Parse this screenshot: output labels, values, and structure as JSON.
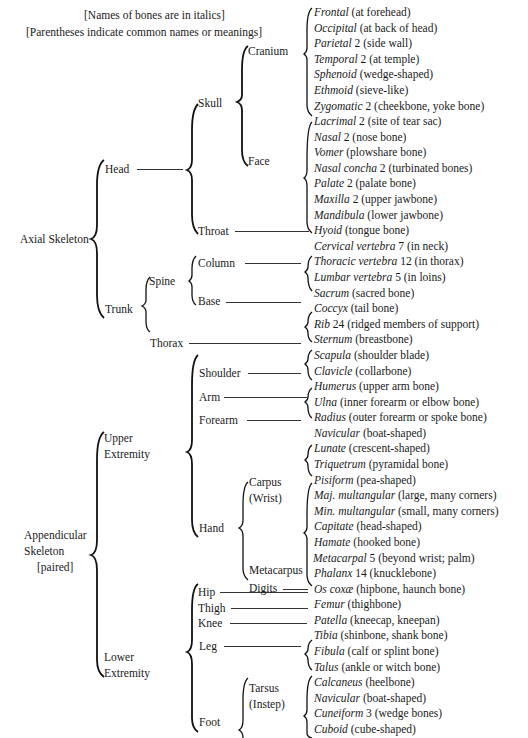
{
  "notes": {
    "italics": "[Names of bones are in italics]",
    "parentheses": "[Parentheses indicate common names or meanings]"
  },
  "divisions": {
    "axial": "Axial Skeleton",
    "appendicular_1": "Appendicular",
    "appendicular_2": "Skeleton",
    "appendicular_3": "[paired]"
  },
  "regions": {
    "head": "Head",
    "trunk": "Trunk",
    "skull": "Skull",
    "throat": "Throat",
    "cranium": "Cranium",
    "face": "Face",
    "spine": "Spine",
    "thorax": "Thorax",
    "column": "Column",
    "base": "Base",
    "upper_1": "Upper",
    "upper_2": "Extremity",
    "lower_1": "Lower",
    "lower_2": "Extremity",
    "shoulder": "Shoulder",
    "arm": "Arm",
    "forearm": "Forearm",
    "hand": "Hand",
    "carpus_1": "Carpus",
    "carpus_2": "(Wrist)",
    "metacarpus": "Metacarpus",
    "digits": "Digits",
    "hip": "Hip",
    "thigh": "Thigh",
    "knee": "Knee",
    "leg": "Leg",
    "foot": "Foot",
    "tarsus_1": "Tarsus",
    "tarsus_2": "(Instep)"
  },
  "bones": [
    {
      "name": "Frontal",
      "count": "",
      "meaning": "(at forehead)"
    },
    {
      "name": "Occipital",
      "count": "",
      "meaning": "(at back of head)"
    },
    {
      "name": "Parietal",
      "count": "2",
      "meaning": "(side wall)"
    },
    {
      "name": "Temporal",
      "count": "2",
      "meaning": "(at temple)"
    },
    {
      "name": "Sphenoid",
      "count": "",
      "meaning": "(wedge-shaped)"
    },
    {
      "name": "Ethmoid",
      "count": "",
      "meaning": "(sieve-like)"
    },
    {
      "name": "Zygomatic",
      "count": "2",
      "meaning": "(cheekbone, yoke bone)"
    },
    {
      "name": "Lacrimal",
      "count": "2",
      "meaning": "(site of tear sac)"
    },
    {
      "name": "Nasal",
      "count": "2",
      "meaning": "(nose bone)"
    },
    {
      "name": "Vomer",
      "count": "",
      "meaning": "(plowshare bone)"
    },
    {
      "name": "Nasal concha",
      "count": "2",
      "meaning": "(turbinated bones)"
    },
    {
      "name": "Palate",
      "count": "2",
      "meaning": "(palate bone)"
    },
    {
      "name": "Maxilla",
      "count": "2",
      "meaning": "(upper jawbone)"
    },
    {
      "name": "Mandibula",
      "count": "",
      "meaning": "(lower jawbone)"
    },
    {
      "name": "Hyoid",
      "count": "",
      "meaning": "(tongue bone)"
    },
    {
      "name": "Cervical vertebra",
      "count": "7",
      "meaning": "(in neck)"
    },
    {
      "name": "Thoracic vertebra",
      "count": "12",
      "meaning": "(in thorax)"
    },
    {
      "name": "Lumbar vertebra",
      "count": "5",
      "meaning": "(in loins)"
    },
    {
      "name": "Sacrum",
      "count": "",
      "meaning": "(sacred bone)"
    },
    {
      "name": "Coccyx",
      "count": "",
      "meaning": "(tail bone)"
    },
    {
      "name": "Rib",
      "count": "24",
      "meaning": "(ridged members of support)"
    },
    {
      "name": "Sternum",
      "count": "",
      "meaning": "(breastbone)"
    },
    {
      "name": "Scapula",
      "count": "",
      "meaning": "(shoulder blade)"
    },
    {
      "name": "Clavicle",
      "count": "",
      "meaning": "(collarbone)"
    },
    {
      "name": "Humerus",
      "count": "",
      "meaning": "(upper arm bone)"
    },
    {
      "name": "Ulna",
      "count": "",
      "meaning": "(inner forearm or elbow bone)"
    },
    {
      "name": "Radius",
      "count": "",
      "meaning": "(outer forearm or spoke bone)"
    },
    {
      "name": "Navicular",
      "count": "",
      "meaning": "(boat-shaped)"
    },
    {
      "name": "Lunate",
      "count": "",
      "meaning": "(crescent-shaped)"
    },
    {
      "name": "Triquetrum",
      "count": "",
      "meaning": "(pyramidal bone)"
    },
    {
      "name": "Pisiform",
      "count": "",
      "meaning": "(pea-shaped)"
    },
    {
      "name": "Maj. multangular",
      "count": "",
      "meaning": "(large, many corners)"
    },
    {
      "name": "Min. multangular",
      "count": "",
      "meaning": "(small, many corners)"
    },
    {
      "name": "Capitate",
      "count": "",
      "meaning": "(head-shaped)"
    },
    {
      "name": "Hamate",
      "count": "",
      "meaning": "(hooked bone)"
    },
    {
      "name": "Metacarpal",
      "count": "5",
      "meaning": "(beyond wrist; palm)"
    },
    {
      "name": "Phalanx",
      "count": "14",
      "meaning": "(knucklebone)"
    },
    {
      "name": "Os coxæ",
      "count": "",
      "meaning": "(hipbone, haunch bone)"
    },
    {
      "name": "Femur",
      "count": "",
      "meaning": "(thighbone)"
    },
    {
      "name": "Patella",
      "count": "",
      "meaning": "(kneecap, kneepan)"
    },
    {
      "name": "Tibia",
      "count": "",
      "meaning": "(shinbone, shank bone)"
    },
    {
      "name": "Fibula",
      "count": "",
      "meaning": "(calf or splint bone)"
    },
    {
      "name": "Talus",
      "count": "",
      "meaning": "(ankle or witch bone)"
    },
    {
      "name": "Calcaneus",
      "count": "",
      "meaning": "(heelbone)"
    },
    {
      "name": "Navicular",
      "count": "",
      "meaning": "(boat-shaped)"
    },
    {
      "name": "Cuneiform",
      "count": "3",
      "meaning": "(wedge bones)"
    },
    {
      "name": "Cuboid",
      "count": "",
      "meaning": "(cube-shaped)"
    }
  ]
}
